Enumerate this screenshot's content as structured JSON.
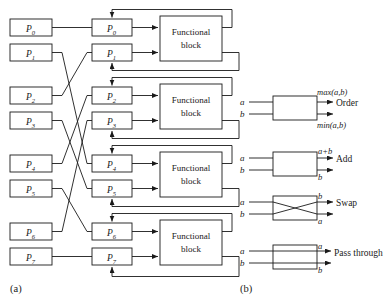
{
  "figure": {
    "panel_a": {
      "caption": "(a)",
      "input_registers": [
        {
          "name": "P",
          "index": "0"
        },
        {
          "name": "P",
          "index": "1"
        },
        {
          "name": "P",
          "index": "2"
        },
        {
          "name": "P",
          "index": "3"
        },
        {
          "name": "P",
          "index": "4"
        },
        {
          "name": "P",
          "index": "5"
        },
        {
          "name": "P",
          "index": "6"
        },
        {
          "name": "P",
          "index": "7"
        }
      ],
      "stage_registers": [
        {
          "name": "P",
          "index": "0"
        },
        {
          "name": "P",
          "index": "1"
        },
        {
          "name": "P",
          "index": "2"
        },
        {
          "name": "P",
          "index": "3"
        },
        {
          "name": "P",
          "index": "4"
        },
        {
          "name": "P",
          "index": "5"
        },
        {
          "name": "P",
          "index": "6"
        },
        {
          "name": "P",
          "index": "7"
        }
      ],
      "functional_blocks": [
        {
          "line1": "Functional",
          "line2": "block"
        },
        {
          "line1": "Functional",
          "line2": "block"
        },
        {
          "line1": "Functional",
          "line2": "block"
        },
        {
          "line1": "Functional",
          "line2": "block"
        }
      ],
      "permutation": {
        "description": "shuffle interconnect between input registers and stage registers",
        "pairs": [
          {
            "from": 0,
            "to": 0
          },
          {
            "from": 1,
            "to": 4
          },
          {
            "from": 2,
            "to": 1
          },
          {
            "from": 3,
            "to": 5
          },
          {
            "from": 4,
            "to": 2
          },
          {
            "from": 5,
            "to": 6
          },
          {
            "from": 6,
            "to": 3
          },
          {
            "from": 7,
            "to": 7
          }
        ]
      }
    },
    "panel_b": {
      "caption": "(b)",
      "operations": [
        {
          "label": "Order",
          "inputs": [
            "a",
            "b"
          ],
          "output_top": "max(a,b)",
          "output_bottom": "min(a,b)",
          "crossed": false
        },
        {
          "label": "Add",
          "inputs": [
            "a",
            "b"
          ],
          "output_top": "a+b",
          "output_bottom": "b",
          "crossed": false
        },
        {
          "label": "Swap",
          "inputs": [
            "a",
            "b"
          ],
          "output_top": "b",
          "output_bottom": "a",
          "crossed": true
        },
        {
          "label": "Pass through",
          "inputs": [
            "a",
            "b"
          ],
          "output_top": "a",
          "output_bottom": "b",
          "crossed": false
        }
      ]
    },
    "colors": {
      "stroke": "#1a1a1a",
      "background": "#ffffff",
      "box_fill": "#ffffff"
    }
  }
}
